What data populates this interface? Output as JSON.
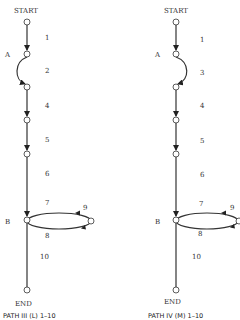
{
  "diagrams": [
    {
      "id": "path3",
      "caption": "PATH III (L) 1–10",
      "start_label": "START",
      "end_label": "END",
      "node_labels": {
        "a": "A",
        "b": "B"
      },
      "edge_labels": [
        "1",
        "2",
        "4",
        "5",
        "6",
        "7",
        "8",
        "9",
        "10"
      ],
      "detour_direction": "left"
    },
    {
      "id": "path4",
      "caption": "PATH IV (M) 1–10",
      "start_label": "START",
      "end_label": "END",
      "node_labels": {
        "a": "A",
        "b": "B"
      },
      "edge_labels": [
        "1",
        "3",
        "4",
        "5",
        "6",
        "7",
        "8",
        "9",
        "10"
      ],
      "detour_direction": "right"
    }
  ]
}
